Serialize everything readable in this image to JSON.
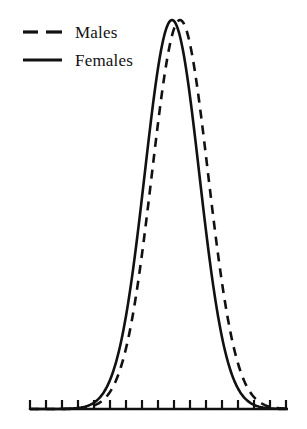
{
  "chart_data": {
    "type": "line",
    "title": "",
    "subtitle": "",
    "xlabel": "",
    "ylabel": "",
    "grid": false,
    "legend_position": "top-left",
    "axis": {
      "baseline_y": 409,
      "x_start": 30,
      "x_end": 288,
      "tick_count": 17,
      "tick_spacing": 16,
      "tick_length": 9,
      "tick_labels": [],
      "y_axis_visible": false
    },
    "xlim": [
      0,
      16
    ],
    "ylim": [
      0,
      1
    ],
    "series": [
      {
        "name": "Males",
        "style": "dashed",
        "color": "#111111",
        "line_width": 2.6,
        "dash_pattern": "9 7",
        "mean": 9.4,
        "sigma": 1.75,
        "peak_x": 180,
        "peak_y": 20,
        "x": [
          0,
          1,
          2,
          3,
          4,
          5,
          6,
          7,
          8,
          9,
          10,
          11,
          12,
          13,
          14,
          15,
          16
        ],
        "values": [
          0.0,
          0.0,
          0.0,
          0.0,
          0.002,
          0.012,
          0.06,
          0.2,
          0.53,
          0.88,
          1.0,
          0.82,
          0.45,
          0.16,
          0.04,
          0.006,
          0.0
        ]
      },
      {
        "name": "Females",
        "style": "solid",
        "color": "#111111",
        "line_width": 2.6,
        "dash_pattern": "",
        "mean": 8.9,
        "sigma": 1.7,
        "peak_x": 172,
        "peak_y": 20,
        "x": [
          0,
          1,
          2,
          3,
          4,
          5,
          6,
          7,
          8,
          9,
          10,
          11,
          12,
          13,
          14,
          15,
          16
        ],
        "values": [
          0.0,
          0.0,
          0.0,
          0.001,
          0.009,
          0.05,
          0.18,
          0.5,
          0.87,
          1.0,
          0.8,
          0.43,
          0.15,
          0.035,
          0.005,
          0.0,
          0.0
        ]
      }
    ]
  },
  "legend": {
    "entries": [
      {
        "label": "Males",
        "style": "dashed"
      },
      {
        "label": "Females",
        "style": "solid"
      }
    ]
  },
  "colors": {
    "ink": "#111111",
    "background": "#ffffff"
  }
}
